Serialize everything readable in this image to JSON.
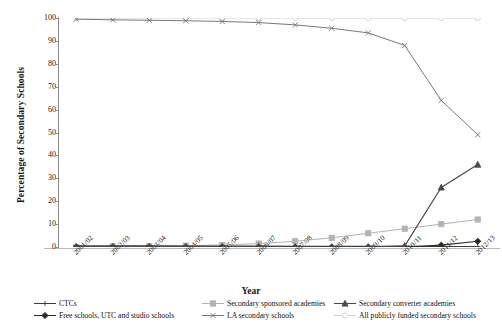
{
  "chart_data": {
    "type": "line",
    "title": "",
    "xlabel": "Year",
    "ylabel": "Percentage of Secondary Schools",
    "ylim": [
      0,
      100
    ],
    "yticks": [
      0,
      10,
      20,
      30,
      40,
      50,
      60,
      70,
      80,
      90,
      100
    ],
    "grid": false,
    "legend_position": "bottom",
    "categories": [
      "2001/02",
      "2002/03",
      "2003/04",
      "2004/05",
      "2005/06",
      "2006/07",
      "2007/08",
      "2008/09",
      "2009/10",
      "2010/11",
      "2011/12",
      "2012/13"
    ],
    "series": [
      {
        "name": "CTCs",
        "color": "#3c3c3c",
        "marker": "plus",
        "values": [
          0.5,
          0.5,
          0.5,
          0.4,
          0.4,
          0.4,
          0.3,
          0.3,
          0.3,
          0.3,
          0.2,
          0.2
        ]
      },
      {
        "name": "Secondary sponsored academies",
        "color": "#b3b3b3",
        "marker": "square",
        "values": [
          0.0,
          0.3,
          0.4,
          0.6,
          0.9,
          1.5,
          2.5,
          4.0,
          6.0,
          8.0,
          10.0,
          12.0
        ]
      },
      {
        "name": "Secondary converter academies",
        "color": "#4a4a4a",
        "marker": "triangle",
        "values": [
          0.0,
          0.0,
          0.0,
          0.0,
          0.0,
          0.0,
          0.0,
          0.0,
          0.0,
          0.5,
          26.0,
          36.0
        ]
      },
      {
        "name": "Free schools, UTC and studio schools",
        "color": "#2b2b2b",
        "marker": "diamond",
        "values": [
          0.0,
          0.0,
          0.0,
          0.0,
          0.0,
          0.0,
          0.0,
          0.0,
          0.0,
          0.0,
          0.8,
          2.5
        ]
      },
      {
        "name": "LA secondary schools",
        "color": "#787878",
        "marker": "cross",
        "values": [
          99.5,
          99.2,
          99.0,
          98.8,
          98.5,
          98.0,
          97.0,
          95.5,
          93.5,
          88.0,
          64.0,
          49.0
        ]
      },
      {
        "name": "All publicly funded secondary schools",
        "color": "#cfcfcf",
        "marker": "circle",
        "values": [
          100,
          100,
          100,
          100,
          100,
          100,
          100,
          100,
          100,
          100,
          100,
          100
        ]
      }
    ]
  },
  "legend": {
    "items": [
      "CTCs",
      "Secondary sponsored academies",
      "Secondary converter academies",
      "Free schools, UTC and studio schools",
      "LA secondary schools",
      "All publicly funded secondary schools"
    ]
  }
}
